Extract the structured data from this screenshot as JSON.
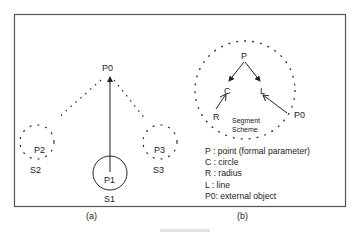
{
  "figure": {
    "panels": [
      {
        "id": "a",
        "caption": "(a)",
        "root": {
          "label": "P0"
        },
        "nodes": [
          {
            "point": "P1",
            "segment": "S1",
            "style": "solid-circle"
          },
          {
            "point": "P2",
            "segment": "S2",
            "style": "dashed-circle"
          },
          {
            "point": "P3",
            "segment": "S3",
            "style": "dashed-circle"
          }
        ]
      },
      {
        "id": "b",
        "caption": "(b)",
        "nodes": {
          "p": "P",
          "c": "C",
          "l": "L",
          "r": "R",
          "p0": "P0"
        },
        "scheme_label_line1": "Segment",
        "scheme_label_line2": "Scheme",
        "legend": [
          "P : point (formal parameter)",
          "C : circle",
          "R : radius",
          "L : line",
          "P0: external object"
        ]
      }
    ]
  }
}
